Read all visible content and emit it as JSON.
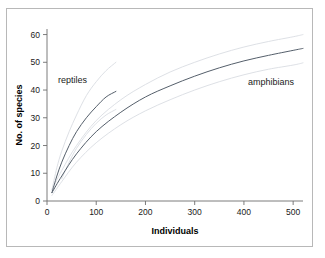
{
  "chart_data": {
    "type": "line",
    "title": "",
    "xlabel": "Individuals",
    "ylabel": "No. of species",
    "xlim": [
      0,
      520
    ],
    "ylim": [
      0,
      62
    ],
    "xticks": [
      0,
      100,
      200,
      300,
      400,
      500
    ],
    "yticks": [
      0,
      10,
      20,
      30,
      40,
      50,
      60
    ],
    "grid": false,
    "legend": "inline-annotations",
    "annotations": [
      {
        "text": "reptiles",
        "x": 60,
        "y": 42
      },
      {
        "text": "amphibians",
        "x": 430,
        "y": 40
      }
    ],
    "series": [
      {
        "name": "reptiles",
        "kind": "mean",
        "x": [
          10,
          20,
          30,
          45,
          60,
          80,
          100,
          120,
          140
        ],
        "y": [
          3,
          9,
          14,
          20,
          25,
          30,
          34,
          37.5,
          39.5
        ]
      },
      {
        "name": "reptiles upper CI",
        "kind": "confidence-upper",
        "x": [
          10,
          20,
          30,
          45,
          60,
          80,
          100,
          120,
          140
        ],
        "y": [
          4,
          12,
          18,
          25,
          31,
          38,
          43,
          47,
          50
        ]
      },
      {
        "name": "reptiles lower CI",
        "kind": "confidence-lower",
        "x": [
          30,
          45,
          60,
          80,
          100,
          120,
          140
        ],
        "y": [
          8,
          14,
          19,
          24,
          28,
          31,
          33
        ]
      },
      {
        "name": "amphibians",
        "kind": "mean",
        "x": [
          10,
          30,
          60,
          100,
          150,
          200,
          250,
          300,
          350,
          400,
          450,
          500,
          520
        ],
        "y": [
          3,
          9,
          17,
          25,
          32,
          37.5,
          41.5,
          45,
          48,
          50.5,
          52.5,
          54.3,
          55
        ]
      },
      {
        "name": "amphibians upper CI",
        "kind": "confidence-upper",
        "x": [
          10,
          30,
          60,
          100,
          150,
          200,
          250,
          300,
          350,
          400,
          450,
          500,
          520
        ],
        "y": [
          4,
          11,
          20,
          29,
          36.5,
          42,
          46.5,
          50,
          53,
          55.5,
          57.5,
          59.2,
          60
        ]
      },
      {
        "name": "amphibians lower CI",
        "kind": "confidence-lower",
        "x": [
          10,
          30,
          60,
          100,
          150,
          200,
          250,
          300,
          350,
          400,
          450,
          500,
          520
        ],
        "y": [
          2,
          7,
          14,
          21,
          27.5,
          32.5,
          36.5,
          40,
          43,
          45.5,
          47.5,
          49,
          49.8
        ]
      }
    ]
  },
  "axes": {
    "x_label": "Individuals",
    "y_label": "No. of species",
    "x_tick_labels": [
      "0",
      "100",
      "200",
      "300",
      "400",
      "500"
    ],
    "y_tick_labels": [
      "0",
      "10",
      "20",
      "30",
      "40",
      "50",
      "60"
    ]
  },
  "labels": {
    "reptiles": "reptiles",
    "amphibians": "amphibians"
  },
  "colors": {
    "curve": "#555f6b",
    "confidence_band": "#d9dde2",
    "axis": "#6e6e6e",
    "frame": "#b8b8b8",
    "background": "#ffffff",
    "text": "#1a1a1a"
  }
}
